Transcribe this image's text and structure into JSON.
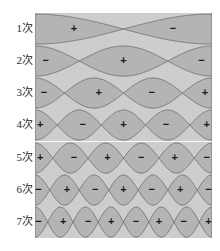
{
  "figure": {
    "title": "",
    "background_color": "#ffffff",
    "plot_background_color": "#cdcdcd",
    "lobe_fill_color": "#b4b4b4",
    "lobe_stroke_color": "#6e6e6e",
    "label_color": "#2b2b2b",
    "sign_color": "#1a1a1a",
    "plot_left_px": 35,
    "plot_right_px": 212,
    "plot_top_px": 13,
    "plot_bottom_px": 238
  },
  "chart_data": {
    "type": "line",
    "title": "",
    "subtitle": "",
    "xlabel": "",
    "ylabel": "",
    "grid": false,
    "legend": "none",
    "x_range": [
      0,
      1
    ],
    "rows": [
      {
        "label": "1次",
        "order": 1,
        "harmonic": 1,
        "nodes": 1,
        "lobe_count": 2,
        "signs": [
          "+",
          "−"
        ],
        "sign_x_fractions": [
          0.22,
          0.78
        ],
        "envelope": "cos(1*pi*x)",
        "phase_offset": 0.0
      },
      {
        "label": "2次",
        "order": 2,
        "harmonic": 2,
        "nodes": 2,
        "lobe_count": 3,
        "signs": [
          "−",
          "+",
          "−"
        ],
        "sign_x_fractions": [
          0.06,
          0.5,
          0.94
        ],
        "envelope": "cos(2*pi*x)",
        "phase_offset": 0.0
      },
      {
        "label": "3次",
        "order": 3,
        "harmonic": 3,
        "nodes": 3,
        "lobe_count": 4,
        "signs": [
          "−",
          "+",
          "−",
          "+"
        ],
        "sign_x_fractions": [
          0.05,
          0.36,
          0.66,
          0.96
        ],
        "envelope": "cos(3*pi*x)",
        "phase_offset": 0.0
      },
      {
        "label": "4次",
        "order": 4,
        "harmonic": 4,
        "nodes": 4,
        "lobe_count": 5,
        "signs": [
          "+",
          "−",
          "+",
          "−",
          "+"
        ],
        "sign_x_fractions": [
          0.03,
          0.27,
          0.5,
          0.74,
          0.97
        ],
        "envelope": "cos(4*pi*x)",
        "phase_offset": 0.0
      },
      {
        "label": "5次",
        "order": 5,
        "harmonic": 5,
        "nodes": 5,
        "lobe_count": 6,
        "signs": [
          "+",
          "−",
          "+",
          "−",
          "+",
          "−"
        ],
        "sign_x_fractions": [
          0.03,
          0.22,
          0.41,
          0.6,
          0.79,
          0.97
        ],
        "envelope": "cos(5*pi*x)",
        "phase_offset": 0.0
      },
      {
        "label": "6次",
        "order": 6,
        "harmonic": 6,
        "nodes": 6,
        "lobe_count": 7,
        "signs": [
          "−",
          "+",
          "−",
          "+",
          "−",
          "+",
          "−"
        ],
        "sign_x_fractions": [
          0.02,
          0.18,
          0.34,
          0.5,
          0.66,
          0.82,
          0.98
        ],
        "envelope": "cos(6*pi*x)",
        "phase_offset": 0.0
      },
      {
        "label": "7次",
        "order": 7,
        "harmonic": 7,
        "nodes": 7,
        "lobe_count": 8,
        "signs": [
          "−",
          "+",
          "−",
          "+",
          "−",
          "+",
          "−",
          "+"
        ],
        "sign_x_fractions": [
          0.02,
          0.16,
          0.3,
          0.43,
          0.57,
          0.7,
          0.84,
          0.98
        ],
        "envelope": "cos(7*pi*x)",
        "phase_offset": 0.0
      }
    ]
  }
}
